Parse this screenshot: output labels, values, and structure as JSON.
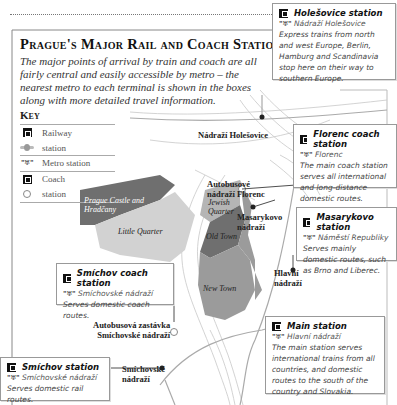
{
  "title": "Prague's Major Rail and Coach Stations",
  "intro": "The major points of arrival by train and coach are all fairly central and easily accessible by metro – the nearest metro to each terminal is shown in the boxes along with more detailed travel information.",
  "key": {
    "title": "Key",
    "items": [
      {
        "icon": "railway-icon",
        "label": "Railway"
      },
      {
        "icon": "railway-station-symbol-icon",
        "label": "station"
      },
      {
        "icon": "metro-icon",
        "label": "Metro station"
      },
      {
        "icon": "coach-icon",
        "label": "Coach"
      },
      {
        "icon": "coach-station-symbol-icon",
        "label": "station"
      }
    ]
  },
  "metro_symbol": "\"♅\"",
  "boxes": {
    "holesovice": {
      "title": "Holešovice station",
      "metro": "Nádraží Holešovice",
      "desc": "Express trains from north and west Europe, Berlin, Hamburg and Scandinavia stop here on their way to southern Europe."
    },
    "florenc": {
      "title": "Florenc coach station",
      "metro": "Florenc",
      "desc": "The main coach station serves all international and long-distance domestic routes."
    },
    "masarykovo": {
      "title": "Masarykovo station",
      "metro": "Náměstí Republiky",
      "desc": "Serves mainly domestic routes, such as Brno and Liberec."
    },
    "smichov_coach": {
      "title": "Smíchov coach station",
      "metro": "Smíchovské nádraží",
      "desc": "Serves domestic coach routes."
    },
    "main": {
      "title": "Main station",
      "metro": "Hlavní nádraží",
      "desc": "The main station serves international trains from all countries, and domestic routes to the south of the country and Slovakia."
    },
    "smichov": {
      "title": "Smíchov station",
      "metro": "Smíchovské nádraží",
      "desc": "Serves domestic rail routes."
    }
  },
  "map_labels": {
    "nadrazi_holesovice": "Nádraží Holešovice",
    "autobusove_florenc_1": "Autobusové",
    "autobusove_florenc_2": "nádraží Florenc",
    "masarykovo_1": "Masarykovo",
    "masarykovo_2": "nádraží",
    "hlavni_1": "Hlavní",
    "hlavni_2": "nádraží",
    "autobusova_zastavka_1": "Autobusová zastávka",
    "autobusova_zastavka_2": "Smíchovské nádraží",
    "smichovske_1": "Smíchovské",
    "smichovske_2": "nádraží",
    "river": "VLTAVA"
  },
  "areas": {
    "castle": "Prague Castle and Hradčany",
    "little_quarter": "Little Quarter",
    "jewish_quarter": "Jewish Quarter",
    "old_town": "Old Town",
    "new_town": "New Town"
  },
  "colors": {
    "dark_area": "#6f6f6f",
    "mid_area": "#9b9b9b",
    "light_area": "#d2d2d2"
  }
}
